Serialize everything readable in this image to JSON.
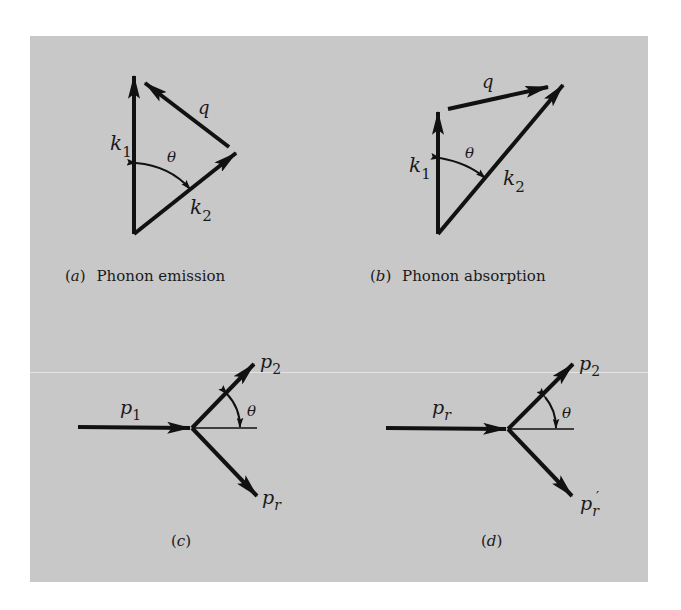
{
  "figure": {
    "background_color": "#c8c8c8",
    "panels": [
      {
        "id": "a",
        "caption_letter": "a",
        "caption_text": "Phonon emission",
        "vectors": {
          "k1": "k",
          "k1_sub": "1",
          "k2": "k",
          "k2_sub": "2",
          "q": "q"
        },
        "angle": "θ"
      },
      {
        "id": "b",
        "caption_letter": "b",
        "caption_text": "Phonon absorption",
        "vectors": {
          "k1": "k",
          "k1_sub": "1",
          "k2": "k",
          "k2_sub": "2",
          "q": "q"
        },
        "angle": "θ"
      },
      {
        "id": "c",
        "caption_letter": "c",
        "vectors": {
          "in": "p",
          "in_sub": "1",
          "out_up": "p",
          "out_up_sub": "2",
          "out_down": "p",
          "out_down_sub": "r"
        },
        "angle": "θ"
      },
      {
        "id": "d",
        "caption_letter": "d",
        "vectors": {
          "in": "p",
          "in_sub": "r",
          "out_up": "p",
          "out_up_sub": "2",
          "out_down": "p",
          "out_down_sub": "r",
          "out_down_prime": "′"
        },
        "angle": "θ"
      }
    ]
  }
}
